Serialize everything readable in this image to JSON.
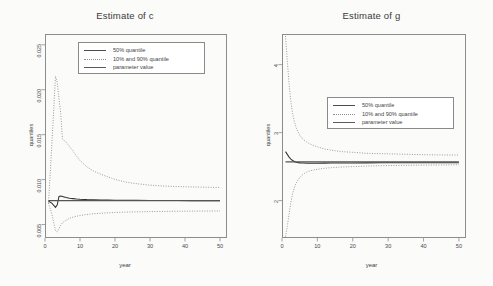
{
  "figure": {
    "background": "#fbfbfa",
    "axis_color": "#8d8d8d",
    "median_color": "#333333",
    "quantile_color": "#8e8e8e",
    "parameter_color": "#555555"
  },
  "chart_data": [
    {
      "type": "line",
      "title": "Estimate of c",
      "xlabel": "year",
      "ylabel": "quantiles",
      "xlim": [
        0,
        52
      ],
      "ylim": [
        0.0035,
        0.0262
      ],
      "xticks": [
        0,
        10,
        20,
        30,
        40,
        50
      ],
      "xtick_labels": [
        "0",
        "10",
        "20",
        "30",
        "40",
        "50"
      ],
      "yticks": [
        0.005,
        0.01,
        0.015,
        0.02,
        0.025
      ],
      "ytick_labels": [
        "0.005",
        "0.010",
        "0.015",
        "0.020",
        "0.025"
      ],
      "grid": false,
      "legend_position": "top-center",
      "legend": [
        {
          "label": "50% quantile",
          "style": "solid"
        },
        {
          "label": "10% and 90% quantile",
          "style": "dotted"
        },
        {
          "label": "parameter value",
          "style": "solid"
        }
      ],
      "parameter_value": 0.00765,
      "x": [
        1,
        2,
        3,
        3.5,
        4,
        4.5,
        5,
        5.5,
        6,
        7,
        8,
        9,
        10,
        12,
        14,
        16,
        18,
        20,
        23,
        26,
        30,
        34,
        38,
        42,
        46,
        50
      ],
      "series": [
        {
          "name": "90% quantile",
          "style": "dotted",
          "values": [
            0.00735,
            0.0142,
            0.0215,
            0.0208,
            0.019,
            0.0173,
            0.01452,
            0.01432,
            0.0142,
            0.01368,
            0.01318,
            0.01262,
            0.01212,
            0.0114,
            0.01092,
            0.01058,
            0.0103,
            0.01002,
            0.00972,
            0.00955,
            0.00938,
            0.00928,
            0.00922,
            0.00918,
            0.00915,
            0.00912
          ]
        },
        {
          "name": "50% quantile",
          "style": "solid",
          "values": [
            0.00762,
            0.00735,
            0.0069,
            0.0072,
            0.00812,
            0.00818,
            0.00812,
            0.00806,
            0.008,
            0.00792,
            0.00788,
            0.00784,
            0.00781,
            0.00777,
            0.00775,
            0.00773,
            0.00772,
            0.00771,
            0.0077,
            0.00769,
            0.00768,
            0.00767,
            0.00767,
            0.00766,
            0.00766,
            0.00766
          ]
        },
        {
          "name": "10% quantile",
          "style": "dotted",
          "values": [
            0.0074,
            0.00612,
            0.00432,
            0.00418,
            0.00455,
            0.00492,
            0.0052,
            0.00535,
            0.00548,
            0.00568,
            0.00582,
            0.00592,
            0.006,
            0.00612,
            0.0062,
            0.00626,
            0.0063,
            0.00634,
            0.00638,
            0.00641,
            0.00644,
            0.00646,
            0.00648,
            0.00649,
            0.0065,
            0.00651
          ]
        },
        {
          "name": "parameter value",
          "style": "solid-flat",
          "values": [
            0.00765,
            0.00765,
            0.00765,
            0.00765,
            0.00765,
            0.00765,
            0.00765,
            0.00765,
            0.00765,
            0.00765,
            0.00765,
            0.00765,
            0.00765,
            0.00765,
            0.00765,
            0.00765,
            0.00765,
            0.00765,
            0.00765,
            0.00765,
            0.00765,
            0.00765,
            0.00765,
            0.00765,
            0.00765,
            0.00765
          ]
        }
      ]
    },
    {
      "type": "line",
      "title": "Estimate of g",
      "xlabel": "year",
      "ylabel": "quantiles",
      "xlim": [
        0,
        52
      ],
      "ylim": [
        1.45,
        4.45
      ],
      "xticks": [
        0,
        10,
        20,
        30,
        40,
        50
      ],
      "xtick_labels": [
        "0",
        "10",
        "20",
        "30",
        "40",
        "50"
      ],
      "yticks": [
        2,
        3,
        4
      ],
      "ytick_labels": [
        "2",
        "3",
        "4"
      ],
      "grid": false,
      "legend_position": "center",
      "legend": [
        {
          "label": "50% quantile",
          "style": "solid"
        },
        {
          "label": "10% and 90% quantile",
          "style": "dotted"
        },
        {
          "label": "parameter value",
          "style": "solid"
        }
      ],
      "parameter_value": 2.57,
      "x": [
        1,
        1.5,
        2,
        2.5,
        3,
        3.5,
        4,
        5,
        6,
        7,
        8,
        10,
        12,
        14,
        17,
        20,
        24,
        28,
        32,
        36,
        40,
        44,
        48,
        50
      ],
      "series": [
        {
          "name": "90% quantile",
          "style": "dotted",
          "values": [
            4.42,
            4.05,
            3.72,
            3.46,
            3.28,
            3.16,
            3.07,
            2.96,
            2.9,
            2.86,
            2.83,
            2.79,
            2.76,
            2.74,
            2.72,
            2.71,
            2.695,
            2.69,
            2.685,
            2.68,
            2.675,
            2.672,
            2.67,
            2.67
          ]
        },
        {
          "name": "50% quantile",
          "style": "solid",
          "values": [
            2.72,
            2.68,
            2.64,
            2.61,
            2.59,
            2.575,
            2.565,
            2.555,
            2.552,
            2.55,
            2.55,
            2.55,
            2.551,
            2.552,
            2.553,
            2.554,
            2.555,
            2.556,
            2.556,
            2.557,
            2.557,
            2.557,
            2.557,
            2.557
          ]
        },
        {
          "name": "10% quantile",
          "style": "dotted",
          "values": [
            1.47,
            1.62,
            1.8,
            1.97,
            2.1,
            2.19,
            2.26,
            2.34,
            2.39,
            2.42,
            2.44,
            2.46,
            2.475,
            2.485,
            2.495,
            2.5,
            2.508,
            2.513,
            2.517,
            2.52,
            2.522,
            2.524,
            2.526,
            2.527
          ]
        },
        {
          "name": "parameter value",
          "style": "solid-flat",
          "values": [
            2.57,
            2.57,
            2.57,
            2.57,
            2.57,
            2.57,
            2.57,
            2.57,
            2.57,
            2.57,
            2.57,
            2.57,
            2.57,
            2.57,
            2.57,
            2.57,
            2.57,
            2.57,
            2.57,
            2.57,
            2.57,
            2.57,
            2.57,
            2.57
          ]
        }
      ]
    }
  ]
}
